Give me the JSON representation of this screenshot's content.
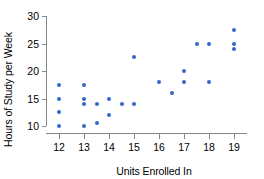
{
  "chart_data": {
    "type": "scatter",
    "title": "",
    "xlabel": "Units Enrolled In",
    "ylabel": "Hours of Study per Week",
    "xlim": [
      11.5,
      19.5
    ],
    "ylim": [
      9,
      30.5
    ],
    "xticks": [
      12,
      13,
      14,
      15,
      16,
      17,
      18,
      19
    ],
    "yticks": [
      10,
      15,
      20,
      25,
      30
    ],
    "xtick_labels": [
      "12",
      "13",
      "14",
      "15",
      "16",
      "17",
      "18",
      "19"
    ],
    "ytick_labels": [
      "10",
      "15",
      "20",
      "25",
      "30"
    ],
    "grid": false,
    "legend": "none",
    "marker_color": "#3366cc",
    "axis_color": "#888888",
    "points": [
      {
        "x": 12,
        "y": 17.5
      },
      {
        "x": 12,
        "y": 15
      },
      {
        "x": 12,
        "y": 12.5
      },
      {
        "x": 12,
        "y": 10
      },
      {
        "x": 13,
        "y": 17.5
      },
      {
        "x": 13,
        "y": 15
      },
      {
        "x": 13,
        "y": 14
      },
      {
        "x": 13,
        "y": 10
      },
      {
        "x": 13.5,
        "y": 14
      },
      {
        "x": 13.5,
        "y": 10.5
      },
      {
        "x": 14,
        "y": 15
      },
      {
        "x": 14,
        "y": 12
      },
      {
        "x": 14.5,
        "y": 14
      },
      {
        "x": 15,
        "y": 22.5
      },
      {
        "x": 15,
        "y": 14
      },
      {
        "x": 16,
        "y": 18
      },
      {
        "x": 16.5,
        "y": 16
      },
      {
        "x": 17,
        "y": 20
      },
      {
        "x": 17,
        "y": 18
      },
      {
        "x": 17.5,
        "y": 25
      },
      {
        "x": 18,
        "y": 25
      },
      {
        "x": 18,
        "y": 18
      },
      {
        "x": 19,
        "y": 27.5
      },
      {
        "x": 19,
        "y": 25
      },
      {
        "x": 19,
        "y": 24
      }
    ]
  }
}
